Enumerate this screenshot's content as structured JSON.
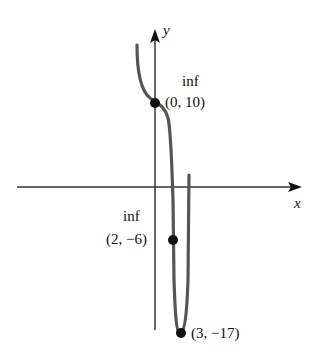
{
  "axes": {
    "x_label": "x",
    "y_label": "y"
  },
  "points": [
    {
      "label": "(0, 10)",
      "note": "inf",
      "x": 0,
      "y": 10
    },
    {
      "label": "(2, −6)",
      "note": "inf",
      "x": 2,
      "y": -6
    },
    {
      "label": "(3, −17)",
      "note": "",
      "x": 3,
      "y": -17
    }
  ],
  "colors": {
    "curve": "#555555",
    "axis": "#222222",
    "point": "#111111"
  }
}
